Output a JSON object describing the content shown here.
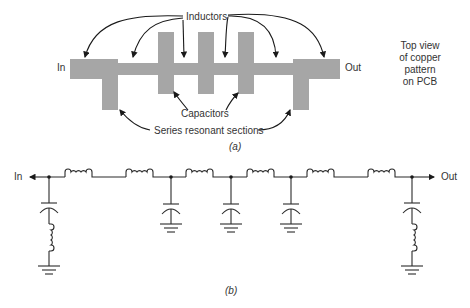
{
  "part_a": {
    "caption": "(a)",
    "labels": {
      "inductors": "Inductors",
      "capacitors": "Capacitors",
      "series_resonant": "Series resonant sections",
      "in": "In",
      "out": "Out",
      "top_view": [
        "Top view",
        "of copper",
        "pattern",
        "on PCB"
      ]
    },
    "colors": {
      "copper": "#a6a6a6",
      "arrow": "#1a1a1a"
    }
  },
  "part_b": {
    "caption": "(b)",
    "labels": {
      "in": "In",
      "out": "Out"
    },
    "series_inductors": 6,
    "shunt_capacitors": 3,
    "series_resonant_branches": 2
  }
}
